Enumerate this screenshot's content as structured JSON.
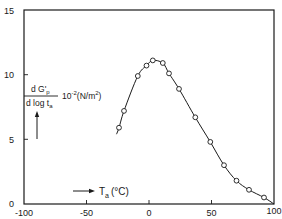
{
  "chart_data": {
    "type": "line",
    "title": "",
    "xlabel": "T_a (°C)",
    "ylabel": "d G'_p / d log t_a  10^-2 (N/m^2)",
    "xlim": [
      -100,
      100
    ],
    "ylim": [
      0,
      15
    ],
    "x_ticks": [
      -100,
      -50,
      0,
      50,
      100
    ],
    "y_ticks": [
      0,
      5,
      10,
      15
    ],
    "grid": false,
    "legend": null,
    "series": [
      {
        "name": "measured",
        "marker": "open-circle",
        "line": "smooth",
        "x": [
          -24,
          -20,
          -9,
          -2,
          3,
          11,
          16,
          24,
          37,
          49,
          60,
          70,
          80,
          92
        ],
        "y": [
          5.9,
          7.2,
          9.9,
          10.7,
          11.1,
          10.9,
          10.1,
          8.9,
          6.7,
          4.8,
          3.0,
          1.8,
          1.1,
          0.5
        ]
      }
    ],
    "curve_start": {
      "x": -26,
      "y": 5.4
    },
    "curve_end": {
      "x": 100,
      "y": 0.0
    }
  },
  "labels": {
    "y_numerator": "d G'",
    "y_numerator_sub": "p",
    "y_denominator": "d log t",
    "y_denominator_sub": "a",
    "y_factor": "10",
    "y_factor_exp": "-2",
    "y_units": "(N/m",
    "y_units_exp": "2",
    "y_units_close": ")",
    "x_symbol": "T",
    "x_symbol_sub": "a",
    "x_units": "(°C)"
  },
  "tick_labels": {
    "x": [
      "-100",
      "-50",
      "0",
      "50",
      "100"
    ],
    "y": [
      "0",
      "5",
      "10",
      "15"
    ]
  }
}
